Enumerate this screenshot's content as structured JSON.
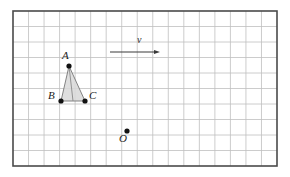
{
  "figure": {
    "background_color": "#ffffff",
    "canvas": {
      "width": 290,
      "height": 177
    },
    "grid": {
      "x": 13,
      "y": 11,
      "width": 264,
      "height": 155,
      "columns": 17,
      "rows": 10,
      "cell_width": 15.53,
      "cell_height": 15.5,
      "line_color": "#bfbfbf",
      "line_width": 0.8,
      "border_color": "#4a4a4a",
      "border_width": 1.6,
      "fill_color": "#ffffff"
    },
    "triangle": {
      "name": "triangle-abc",
      "fill_color": "#d8d8d8",
      "fill_opacity": 0.85,
      "stroke_color": "#777777",
      "stroke_width": 0.9,
      "median_stroke_color": "#8a8a8a",
      "vertices": [
        {
          "label": "A",
          "x": 69,
          "y": 66,
          "label_x": 62,
          "label_y": 59
        },
        {
          "label": "B",
          "x": 61,
          "y": 101,
          "label_x": 48,
          "label_y": 99
        },
        {
          "label": "C",
          "x": 85,
          "y": 101,
          "label_x": 89,
          "label_y": 99
        }
      ]
    },
    "points": [
      {
        "label": "O",
        "name": "point-o",
        "x": 127,
        "y": 131,
        "label_x": 119,
        "label_y": 142
      }
    ],
    "dot": {
      "radius": 2.6,
      "color": "#111111"
    },
    "vector": {
      "name": "vector-v",
      "label": "v",
      "label_x": 137,
      "label_y": 43,
      "x1": 110,
      "y1": 52,
      "x2": 160,
      "y2": 52,
      "stroke_color": "#3a3a3a",
      "stroke_width": 1.2,
      "arrow_head_length": 6,
      "arrow_head_width": 4
    }
  }
}
